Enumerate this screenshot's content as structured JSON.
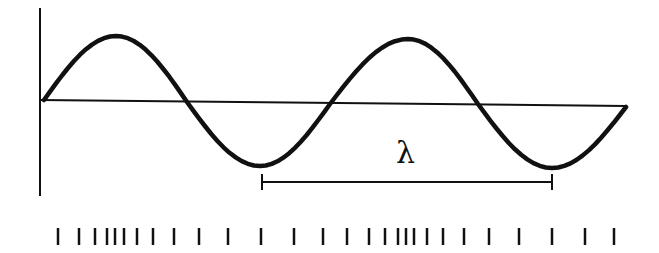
{
  "diagram": {
    "title": "",
    "colors": {
      "stroke": "#111111",
      "background": "#ffffff"
    },
    "wavelength_label": "λ",
    "wave": {
      "start": [
        44,
        100
      ],
      "peaks": [
        [
          116,
          36
        ],
        [
          408,
          39
        ]
      ],
      "troughs": [
        [
          260,
          166
        ],
        [
          552,
          168
        ]
      ],
      "zero_crossings": [
        [
          187,
          102
        ],
        [
          330,
          104
        ],
        [
          478,
          104
        ]
      ],
      "end": [
        626,
        107
      ]
    },
    "axes": {
      "vertical": {
        "x": 40,
        "y1": 8,
        "y2": 196
      },
      "horizontal": {
        "x1": 40,
        "y1": 100,
        "x2": 626,
        "y2": 106
      }
    },
    "wavelength_bracket": {
      "x1": 262,
      "x2": 552,
      "y": 182
    },
    "density_ticks": {
      "y1": 228,
      "y2": 245,
      "x": [
        58,
        79,
        95,
        107,
        115,
        124,
        137,
        153,
        174,
        199,
        228,
        261,
        294,
        323,
        347,
        369,
        385,
        398,
        406,
        414,
        427,
        443,
        464,
        489,
        519,
        552,
        585,
        614
      ]
    }
  }
}
